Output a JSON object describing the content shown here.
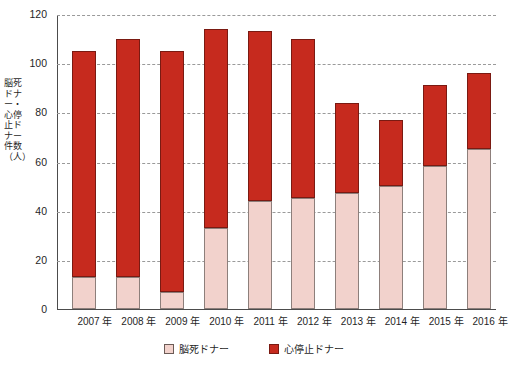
{
  "chart_data": {
    "type": "bar",
    "stacked": true,
    "title": "",
    "xlabel": "",
    "ylabel": "脳死ドナー・心停止ドナー件数（人）",
    "ylim": [
      0,
      120
    ],
    "ytick_step": 20,
    "yticks": [
      "0",
      "20",
      "40",
      "60",
      "80",
      "100",
      "120"
    ],
    "grid": true,
    "grid_style": "dashed",
    "legend_position": "bottom-center",
    "categories": [
      "2007 年",
      "2008 年",
      "2009 年",
      "2010 年",
      "2011 年",
      "2012 年",
      "2013 年",
      "2014 年",
      "2015 年",
      "2016 年"
    ],
    "series": [
      {
        "name": "脳死ドナー",
        "color": "#f2d2cc",
        "values": [
          13,
          13,
          7,
          33,
          44,
          45,
          47,
          50,
          58,
          65
        ]
      },
      {
        "name": "心停止ドナー",
        "color": "#c62a1e",
        "values": [
          92,
          97,
          98,
          81,
          69,
          65,
          37,
          27,
          33,
          31
        ]
      }
    ],
    "totals": [
      105,
      110,
      105,
      114,
      113,
      110,
      84,
      77,
      91,
      96
    ]
  },
  "legend": {
    "items": [
      {
        "label": "脳死ドナー",
        "swatch": "legend-swatch-pink"
      },
      {
        "label": "心停止ドナー",
        "swatch": "legend-swatch-red"
      }
    ]
  },
  "axis": {
    "y_title": "脳死ドナー・心停止ドナー件数（人）"
  }
}
